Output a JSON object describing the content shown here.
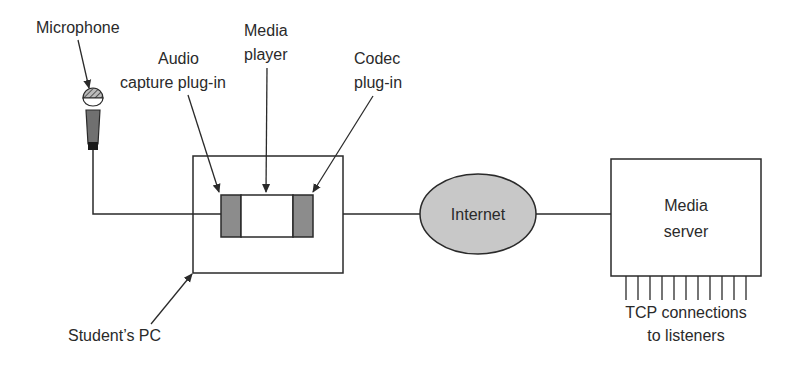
{
  "diagram": {
    "labels": {
      "microphone": "Microphone",
      "audio_capture_line1": "Audio",
      "audio_capture_line2": "capture plug-in",
      "media_player_line1": "Media",
      "media_player_line2": "player",
      "codec_line1": "Codec",
      "codec_line2": "plug-in",
      "internet": "Internet",
      "media_server_line1": "Media",
      "media_server_line2": "server",
      "tcp_line1": "TCP connections",
      "tcp_line2": "to listeners",
      "students_pc": "Student’s PC"
    },
    "colors": {
      "stroke": "#2a2a2a",
      "plugin_fill": "#8c8c8c",
      "internet_fill": "#c8c8c8",
      "mic_body": "#707070"
    },
    "tcp_connection_count": 11
  }
}
